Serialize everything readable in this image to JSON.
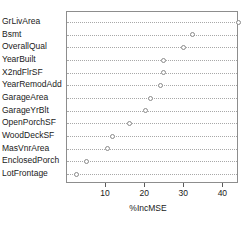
{
  "chart_data": {
    "type": "scatter",
    "title": "",
    "xlabel": "%IncMSE",
    "ylabel": "",
    "xlim": [
      0,
      44
    ],
    "xticks": [
      10,
      20,
      30,
      40
    ],
    "xtick_labels": [
      "10",
      "20",
      "30",
      "40"
    ],
    "grid": true,
    "grid_style": "dotted-horizontal",
    "legend": "none",
    "orientation": "horizontal",
    "marker": "open-circle",
    "categories": [
      "GrLivArea",
      "Bsmt",
      "OverallQual",
      "YearBuilt",
      "X2ndFlrSF",
      "YearRemodAdd",
      "GarageArea",
      "GarageYrBlt",
      "OpenPorchSF",
      "WoodDeckSF",
      "MasVnrArea",
      "EnclosedPorch",
      "LotFrontage"
    ],
    "values": [
      43.8,
      32.0,
      29.8,
      24.7,
      24.7,
      23.9,
      21.4,
      20.1,
      16.0,
      11.7,
      10.4,
      5.1,
      2.5
    ]
  }
}
